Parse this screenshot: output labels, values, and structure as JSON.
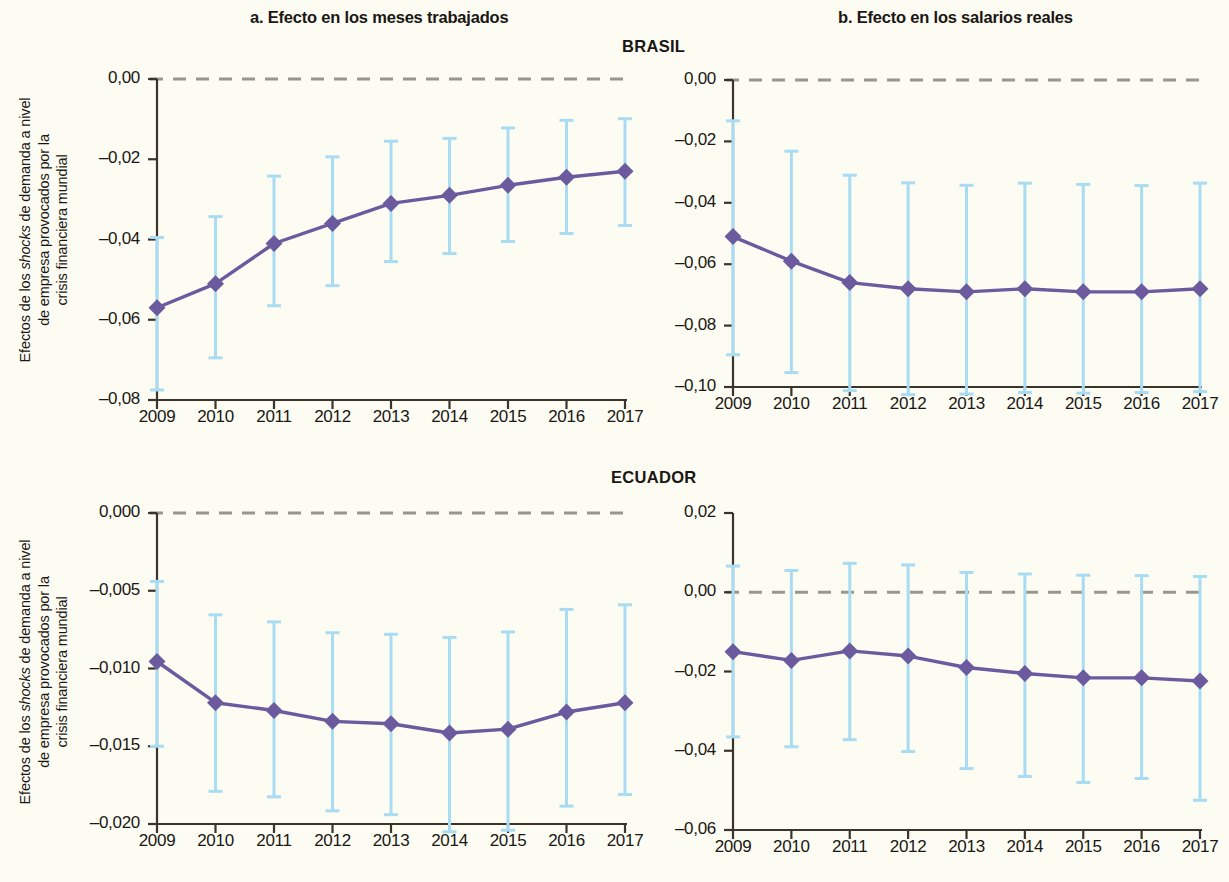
{
  "titles": {
    "panel_a": "a. Efecto en los meses trabajados",
    "panel_b": "b. Efecto en los salarios reales",
    "country_top": "BRASIL",
    "country_bottom": "ECUADOR"
  },
  "axis_label": {
    "line1": "Efectos de los ",
    "shocks": "shocks",
    "line1b": " de demanda a nivel",
    "line2": "de empresa provocados por la",
    "line3": "crisis financiera mundial"
  },
  "colors": {
    "line": "#6b5b9e",
    "marker": "#6b5b9e",
    "error_bar": "#a9dcf2",
    "zero_line": "#9a968c",
    "axis": "#3a342c",
    "background": "#fdfcf3",
    "text": "#1a1714"
  },
  "chart_data": [
    {
      "id": "brasil-meses",
      "type": "line",
      "title": "a. Efecto en los meses trabajados",
      "subtitle": "BRASIL",
      "xlabel": "",
      "ylabel": "Efectos de los shocks de demanda a nivel de empresa provocados por la crisis financiera mundial",
      "categories": [
        "2009",
        "2010",
        "2011",
        "2012",
        "2013",
        "2014",
        "2015",
        "2016",
        "2017"
      ],
      "x": [
        2009,
        2010,
        2011,
        2012,
        2013,
        2014,
        2015,
        2016,
        2017
      ],
      "values": [
        -0.057,
        -0.051,
        -0.041,
        -0.036,
        -0.031,
        -0.029,
        -0.0265,
        -0.0245,
        -0.023
      ],
      "ci_low": [
        -0.0775,
        -0.0695,
        -0.0565,
        -0.0515,
        -0.0455,
        -0.0435,
        -0.0405,
        -0.0385,
        -0.0365
      ],
      "ci_high": [
        -0.0395,
        -0.0343,
        -0.0242,
        -0.0194,
        -0.0155,
        -0.0148,
        -0.0122,
        -0.0103,
        -0.0099
      ],
      "ylim": [
        -0.08,
        0.0
      ],
      "yticks": [
        0.0,
        -0.02,
        -0.04,
        -0.06,
        -0.08
      ],
      "ytick_labels": [
        "0,00",
        "–0,02",
        "–0,04",
        "–0,06",
        "–0,08"
      ],
      "grid": false,
      "zero_line": 0.0,
      "legend": "none"
    },
    {
      "id": "brasil-salarios",
      "type": "line",
      "title": "b. Efecto en los salarios reales",
      "subtitle": "BRASIL",
      "xlabel": "",
      "ylabel": "",
      "categories": [
        "2009",
        "2010",
        "2011",
        "2012",
        "2013",
        "2014",
        "2015",
        "2016",
        "2017"
      ],
      "x": [
        2009,
        2010,
        2011,
        2012,
        2013,
        2014,
        2015,
        2016,
        2017
      ],
      "values": [
        -0.051,
        -0.059,
        -0.066,
        -0.068,
        -0.069,
        -0.068,
        -0.069,
        -0.069,
        -0.068
      ],
      "ci_low": [
        -0.0895,
        -0.0953,
        -0.1012,
        -0.1025,
        -0.1023,
        -0.1018,
        -0.102,
        -0.1018,
        -0.1015
      ],
      "ci_high": [
        -0.0133,
        -0.0232,
        -0.031,
        -0.0335,
        -0.0343,
        -0.0336,
        -0.034,
        -0.0344,
        -0.0336
      ],
      "ylim": [
        -0.1,
        0.0
      ],
      "yticks": [
        0.0,
        -0.02,
        -0.04,
        -0.06,
        -0.08,
        -0.1
      ],
      "ytick_labels": [
        "0,00",
        "–0,02",
        "–0,04",
        "–0,06",
        "–0,08",
        "–0,10"
      ],
      "grid": false,
      "zero_line": 0.0,
      "legend": "none"
    },
    {
      "id": "ecuador-meses",
      "type": "line",
      "title": "a. Efecto en los meses trabajados",
      "subtitle": "ECUADOR",
      "xlabel": "",
      "ylabel": "Efectos de los shocks de demanda a nivel de empresa provocados por la crisis financiera mundial",
      "categories": [
        "2009",
        "2010",
        "2011",
        "2012",
        "2013",
        "2014",
        "2015",
        "2016",
        "2017"
      ],
      "x": [
        2009,
        2010,
        2011,
        2012,
        2013,
        2014,
        2015,
        2016,
        2017
      ],
      "values": [
        -0.00955,
        -0.0122,
        -0.0127,
        -0.0134,
        -0.01355,
        -0.01415,
        -0.0139,
        -0.0128,
        -0.0122
      ],
      "ci_low": [
        -0.015,
        -0.0179,
        -0.01825,
        -0.01915,
        -0.0194,
        -0.0205,
        -0.0204,
        -0.01885,
        -0.0181
      ],
      "ci_high": [
        -0.0044,
        -0.00655,
        -0.007,
        -0.0077,
        -0.0078,
        -0.008,
        -0.00765,
        -0.0062,
        -0.0059
      ],
      "ylim": [
        -0.02,
        0.0
      ],
      "yticks": [
        0.0,
        -0.005,
        -0.01,
        -0.015,
        -0.02
      ],
      "ytick_labels": [
        "0,000",
        "–0,005",
        "–0,010",
        "–0,015",
        "–0,020"
      ],
      "grid": false,
      "zero_line": 0.0,
      "legend": "none"
    },
    {
      "id": "ecuador-salarios",
      "type": "line",
      "title": "b. Efecto en los salarios reales",
      "subtitle": "ECUADOR",
      "xlabel": "",
      "ylabel": "",
      "categories": [
        "2009",
        "2010",
        "2011",
        "2012",
        "2013",
        "2014",
        "2015",
        "2016",
        "2017"
      ],
      "x": [
        2009,
        2010,
        2011,
        2012,
        2013,
        2014,
        2015,
        2016,
        2017
      ],
      "values": [
        -0.015,
        -0.0172,
        -0.0148,
        -0.0161,
        -0.019,
        -0.0205,
        -0.0216,
        -0.0216,
        -0.0224
      ],
      "ci_low": [
        -0.0365,
        -0.039,
        -0.0372,
        -0.0402,
        -0.0445,
        -0.0465,
        -0.048,
        -0.047,
        -0.0525
      ],
      "ci_high": [
        0.0066,
        0.0055,
        0.0073,
        0.0069,
        0.005,
        0.0046,
        0.0043,
        0.0042,
        0.004
      ],
      "ylim": [
        -0.06,
        0.02
      ],
      "yticks": [
        0.02,
        0.0,
        -0.02,
        -0.04,
        -0.06
      ],
      "ytick_labels": [
        "0,02",
        "0,00",
        "–0,02",
        "–0,04",
        "–0,06"
      ],
      "grid": false,
      "zero_line": 0.0,
      "legend": "none"
    }
  ]
}
